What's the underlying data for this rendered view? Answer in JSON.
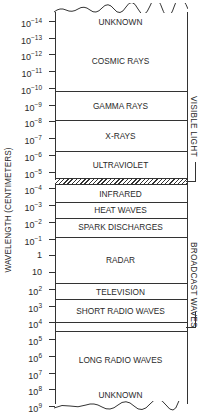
{
  "diagram": {
    "axis_label": "WAVELENGTH (CENTIMETERS)",
    "ticks": [
      {
        "base": "10",
        "exp": "−14"
      },
      {
        "base": "10",
        "exp": "−13"
      },
      {
        "base": "10",
        "exp": "−12"
      },
      {
        "base": "10",
        "exp": "−11"
      },
      {
        "base": "10",
        "exp": "−10"
      },
      {
        "base": "10",
        "exp": "−9"
      },
      {
        "base": "10",
        "exp": "−8"
      },
      {
        "base": "10",
        "exp": "−7"
      },
      {
        "base": "10",
        "exp": "−6"
      },
      {
        "base": "10",
        "exp": "−5"
      },
      {
        "base": "10",
        "exp": "−4"
      },
      {
        "base": "10",
        "exp": "−3"
      },
      {
        "base": "10",
        "exp": "−2"
      },
      {
        "base": "10",
        "exp": "−1"
      },
      {
        "base": "1",
        "exp": ""
      },
      {
        "base": "10",
        "exp": ""
      },
      {
        "base": "10",
        "exp": "2"
      },
      {
        "base": "10",
        "exp": "3"
      },
      {
        "base": "10",
        "exp": "4"
      },
      {
        "base": "10",
        "exp": "5"
      },
      {
        "base": "10",
        "exp": "6"
      },
      {
        "base": "10",
        "exp": "7"
      },
      {
        "base": "10",
        "exp": "8"
      },
      {
        "base": "10",
        "exp": "9"
      }
    ],
    "bands": [
      {
        "label": "UNKNOWN",
        "label_y": 17
      },
      {
        "label": "COSMIC RAYS",
        "label_y": 56
      },
      {
        "label": "GAMMA RAYS",
        "label_y": 101
      },
      {
        "label": "X-RAYS",
        "label_y": 131
      },
      {
        "label": "ULTRAVIOLET",
        "label_y": 160
      },
      {
        "label": "INFRARED",
        "label_y": 189
      },
      {
        "label": "HEAT WAVES",
        "label_y": 205
      },
      {
        "label": "SPARK DISCHARGES",
        "label_y": 222
      },
      {
        "label": "RADAR",
        "label_y": 255
      },
      {
        "label": "TELEVISION",
        "label_y": 287
      },
      {
        "label": "SHORT RADIO WAVES",
        "label_y": 306
      },
      {
        "label": "LONG RADIO WAVES",
        "label_y": 355
      },
      {
        "label": "UNKNOWN",
        "label_y": 390
      }
    ],
    "divider_lines_y": [
      91,
      120,
      151,
      202,
      218,
      237,
      283,
      299,
      322,
      331
    ],
    "visible_light_band": {
      "top": 178,
      "height": 7
    },
    "side_labels": {
      "visible_light": "VISIBLE LIGHT",
      "broadcast_waves": "BROADCAST WAVES"
    }
  }
}
